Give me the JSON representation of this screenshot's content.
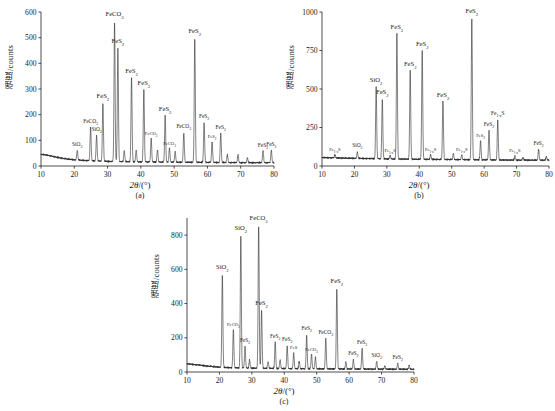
{
  "figure": {
    "axis_x_label_symbol": "2θ",
    "axis_x_label_unit": "/(°)",
    "axis_y_label": "强度/counts",
    "captions": {
      "a": "(a)",
      "b": "(b)",
      "c": "(c)"
    }
  },
  "chart_data": [
    {
      "type": "line",
      "panel": "(a)",
      "title": "",
      "xlabel": "2θ/(°)",
      "ylabel": "强度/counts",
      "xlim": [
        10,
        80
      ],
      "ylim": [
        0,
        600
      ],
      "xticks": [
        10,
        20,
        30,
        40,
        50,
        60,
        70,
        80
      ],
      "yticks": [
        0,
        100,
        200,
        300,
        400,
        500,
        600
      ],
      "grid": false,
      "legend": "none",
      "baseline": [
        {
          "x": 10,
          "y": 46
        },
        {
          "x": 12,
          "y": 42
        },
        {
          "x": 14,
          "y": 36
        },
        {
          "x": 16,
          "y": 31
        },
        {
          "x": 18,
          "y": 27
        },
        {
          "x": 20,
          "y": 24
        },
        {
          "x": 24,
          "y": 21
        },
        {
          "x": 30,
          "y": 18
        },
        {
          "x": 40,
          "y": 16
        },
        {
          "x": 50,
          "y": 15
        },
        {
          "x": 60,
          "y": 14
        },
        {
          "x": 70,
          "y": 13
        },
        {
          "x": 80,
          "y": 13
        }
      ],
      "peaks": [
        {
          "x": 20.9,
          "y": 60,
          "label": "SiO₂",
          "size": "sm"
        },
        {
          "x": 24.9,
          "y": 150,
          "label": "FeCO₃",
          "size": "sm"
        },
        {
          "x": 26.7,
          "y": 118,
          "label": "SiO₂",
          "size": "sm"
        },
        {
          "x": 28.6,
          "y": 245,
          "label": "FeS₂",
          "size": "md"
        },
        {
          "x": 32.1,
          "y": 565,
          "label": "FeCO₃",
          "size": "md"
        },
        {
          "x": 33.1,
          "y": 458,
          "label": "FeS₂",
          "size": "md"
        },
        {
          "x": 35.0,
          "y": 60,
          "label": "",
          "size": "md"
        },
        {
          "x": 37.2,
          "y": 343,
          "label": "FeS₂",
          "size": "md"
        },
        {
          "x": 38.6,
          "y": 62,
          "label": "",
          "size": "md"
        },
        {
          "x": 40.9,
          "y": 298,
          "label": "FeS₂",
          "size": "md"
        },
        {
          "x": 43.1,
          "y": 107,
          "label": "FeCO₃",
          "size": "xs"
        },
        {
          "x": 45.0,
          "y": 64,
          "label": "",
          "size": "md"
        },
        {
          "x": 47.3,
          "y": 196,
          "label": "FeS₂",
          "size": "md"
        },
        {
          "x": 48.6,
          "y": 70,
          "label": "FeCO₃",
          "size": "xs"
        },
        {
          "x": 50.3,
          "y": 57,
          "label": "",
          "size": "md"
        },
        {
          "x": 52.9,
          "y": 130,
          "label": "FeCO₃",
          "size": "sm"
        },
        {
          "x": 56.2,
          "y": 498,
          "label": "FeS₂",
          "size": "md"
        },
        {
          "x": 59.0,
          "y": 168,
          "label": "FeS₂",
          "size": "sm"
        },
        {
          "x": 61.4,
          "y": 96,
          "label": "FeS₂",
          "size": "xs"
        },
        {
          "x": 64.0,
          "y": 128,
          "label": "FeS₂",
          "size": "sm"
        },
        {
          "x": 66.0,
          "y": 45,
          "label": "",
          "size": "md"
        },
        {
          "x": 69.2,
          "y": 42,
          "label": "",
          "size": "md"
        },
        {
          "x": 72.0,
          "y": 32,
          "label": "",
          "size": "md"
        },
        {
          "x": 76.7,
          "y": 58,
          "label": "FeS₂",
          "size": "sm"
        },
        {
          "x": 79.2,
          "y": 62,
          "label": "FeS₂",
          "size": "sm"
        }
      ]
    },
    {
      "type": "line",
      "panel": "(b)",
      "title": "",
      "xlabel": "2θ/(°)",
      "ylabel": "强度/counts",
      "xlim": [
        10,
        80
      ],
      "ylim": [
        0,
        1000
      ],
      "xticks": [
        10,
        20,
        30,
        40,
        50,
        60,
        70,
        80
      ],
      "yticks": [
        0,
        250,
        500,
        750,
        1000
      ],
      "grid": false,
      "legend": "none",
      "baseline": [
        {
          "x": 10,
          "y": 55
        },
        {
          "x": 15,
          "y": 52
        },
        {
          "x": 20,
          "y": 50
        },
        {
          "x": 30,
          "y": 46
        },
        {
          "x": 40,
          "y": 44
        },
        {
          "x": 50,
          "y": 42
        },
        {
          "x": 60,
          "y": 40
        },
        {
          "x": 70,
          "y": 38
        },
        {
          "x": 80,
          "y": 38
        }
      ],
      "peaks": [
        {
          "x": 14.0,
          "y": 72,
          "label": "Fe₁₋ₓS",
          "size": "xs"
        },
        {
          "x": 20.9,
          "y": 92,
          "label": "SiO₂",
          "size": "sm"
        },
        {
          "x": 26.7,
          "y": 512,
          "label": "SiO₂",
          "size": "md"
        },
        {
          "x": 28.6,
          "y": 435,
          "label": "FeS₂",
          "size": "md"
        },
        {
          "x": 31.0,
          "y": 70,
          "label": "Fe₁₋ₓS",
          "size": "xs"
        },
        {
          "x": 33.1,
          "y": 860,
          "label": "FeS₂",
          "size": "md"
        },
        {
          "x": 37.2,
          "y": 620,
          "label": "FeS₂",
          "size": "md"
        },
        {
          "x": 40.9,
          "y": 750,
          "label": "FeS₂",
          "size": "md"
        },
        {
          "x": 43.5,
          "y": 75,
          "label": "Fe₁₋ₓS",
          "size": "xs"
        },
        {
          "x": 47.3,
          "y": 418,
          "label": "FeS₂",
          "size": "md"
        },
        {
          "x": 50.5,
          "y": 80,
          "label": "",
          "size": "md"
        },
        {
          "x": 53.1,
          "y": 72,
          "label": "Fe₁₋ₓS",
          "size": "xs"
        },
        {
          "x": 56.2,
          "y": 962,
          "label": "FeS₂",
          "size": "md"
        },
        {
          "x": 58.9,
          "y": 165,
          "label": "FeS₂",
          "size": "xs"
        },
        {
          "x": 61.5,
          "y": 228,
          "label": "FeS₂",
          "size": "sm"
        },
        {
          "x": 64.2,
          "y": 300,
          "label": "Fe₁₋ₓS",
          "size": "sm"
        },
        {
          "x": 69.5,
          "y": 68,
          "label": "Fe₁₋ₓS",
          "size": "xs"
        },
        {
          "x": 72.0,
          "y": 55,
          "label": "",
          "size": "md"
        },
        {
          "x": 76.8,
          "y": 108,
          "label": "FeS₂",
          "size": "sm"
        },
        {
          "x": 79.2,
          "y": 62,
          "label": "",
          "size": "md"
        }
      ]
    },
    {
      "type": "line",
      "panel": "(c)",
      "title": "",
      "xlabel": "2θ/(°)",
      "ylabel": "强度/counts",
      "xlim": [
        10,
        80
      ],
      "ylim": [
        0,
        900
      ],
      "xticks": [
        10,
        20,
        30,
        40,
        50,
        60,
        70,
        80
      ],
      "yticks": [
        0,
        200,
        400,
        600,
        800
      ],
      "grid": false,
      "legend": "none",
      "baseline": [
        {
          "x": 10,
          "y": 48
        },
        {
          "x": 13,
          "y": 42
        },
        {
          "x": 16,
          "y": 35
        },
        {
          "x": 19,
          "y": 30
        },
        {
          "x": 22,
          "y": 26
        },
        {
          "x": 28,
          "y": 23
        },
        {
          "x": 36,
          "y": 21
        },
        {
          "x": 46,
          "y": 19
        },
        {
          "x": 56,
          "y": 18
        },
        {
          "x": 66,
          "y": 17
        },
        {
          "x": 80,
          "y": 16
        }
      ],
      "peaks": [
        {
          "x": 20.9,
          "y": 570,
          "label": "SiO₂",
          "size": "md"
        },
        {
          "x": 24.3,
          "y": 250,
          "label": "FeCO₃",
          "size": "xs"
        },
        {
          "x": 26.6,
          "y": 800,
          "label": "SiO₂",
          "size": "md"
        },
        {
          "x": 27.9,
          "y": 150,
          "label": "FeS₂",
          "size": "sm"
        },
        {
          "x": 29.3,
          "y": 70,
          "label": "",
          "size": "md"
        },
        {
          "x": 32.1,
          "y": 860,
          "label": "FeCO₃",
          "size": "md"
        },
        {
          "x": 33.0,
          "y": 360,
          "label": "FeS₂",
          "size": "md"
        },
        {
          "x": 35.0,
          "y": 60,
          "label": "",
          "size": "md"
        },
        {
          "x": 37.2,
          "y": 175,
          "label": "FeS₂",
          "size": "sm"
        },
        {
          "x": 38.7,
          "y": 72,
          "label": "",
          "size": "md"
        },
        {
          "x": 40.9,
          "y": 152,
          "label": "FeS₂",
          "size": "sm"
        },
        {
          "x": 42.9,
          "y": 112,
          "label": "FeS",
          "size": "xs"
        },
        {
          "x": 44.6,
          "y": 62,
          "label": "",
          "size": "md"
        },
        {
          "x": 46.9,
          "y": 218,
          "label": "FeS₂",
          "size": "sm"
        },
        {
          "x": 48.4,
          "y": 105,
          "label": "FeCO₃",
          "size": "xs"
        },
        {
          "x": 49.6,
          "y": 88,
          "label": "",
          "size": "md"
        },
        {
          "x": 52.8,
          "y": 195,
          "label": "FeCO₃",
          "size": "sm"
        },
        {
          "x": 56.2,
          "y": 490,
          "label": "FeS₂",
          "size": "md"
        },
        {
          "x": 59.0,
          "y": 60,
          "label": "",
          "size": "md"
        },
        {
          "x": 61.3,
          "y": 72,
          "label": "FeS₂",
          "size": "sm"
        },
        {
          "x": 64.0,
          "y": 138,
          "label": "FeS₂",
          "size": "sm"
        },
        {
          "x": 68.5,
          "y": 62,
          "label": "SiO₂",
          "size": "sm"
        },
        {
          "x": 71.0,
          "y": 35,
          "label": "",
          "size": "md"
        },
        {
          "x": 75.0,
          "y": 52,
          "label": "FeS₂",
          "size": "sm"
        },
        {
          "x": 78.5,
          "y": 40,
          "label": "",
          "size": "md"
        }
      ]
    }
  ]
}
